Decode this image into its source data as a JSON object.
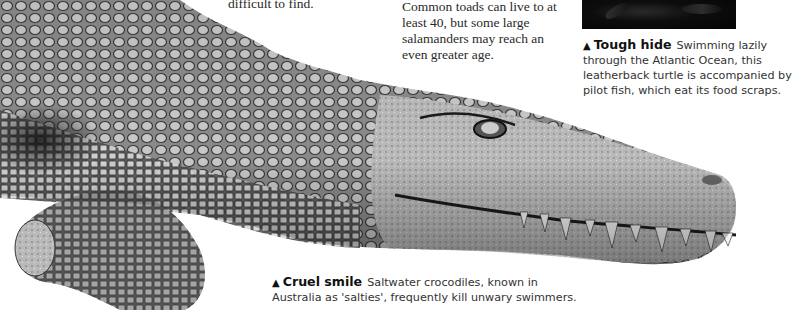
{
  "body_text": {
    "column1_tail": "difficult to find.",
    "column2": "Common toads can live to at least 40, but some large salamanders may reach an even greater age."
  },
  "captions": {
    "turtle": {
      "marker": "▲",
      "heading": "Tough hide",
      "lines": [
        "Swimming lazily",
        "through the Atlantic Ocean, this",
        "leatherback turtle is accompanied by",
        "pilot fish, which eat its food scraps."
      ]
    },
    "crocodile": {
      "marker": "▲",
      "heading": "Cruel smile",
      "lines": [
        "Saltwater crocodiles, known in",
        "Australia as 'salties', frequently kill unwary swimmers."
      ]
    }
  },
  "images": {
    "crocodile_photo": "saltwater-crocodile",
    "turtle_photo": "leatherback-turtle"
  }
}
